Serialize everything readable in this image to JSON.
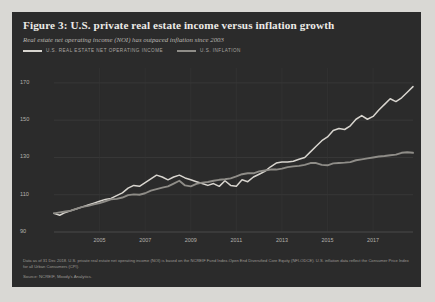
{
  "figure": {
    "title": "Figure 3: U.S. private real estate income versus inflation growth",
    "subtitle": "Real estate net operating income (NOI) has outpaced inflation since 2003",
    "note": "Data as of 31 Dec 2018. U.S. private real estate net operating income (NOI) is based on the NCREIF Fund Index-Open End Diversified Core Equity (NFI-ODCE). U.S. inflation data reflect the Consumer Price Index for all Urban Consumers (CPI).",
    "source": "Source: NCREIF, Moody's Analytics.",
    "panel_color": "#2b2b2b",
    "page_color": "#d9d8d4"
  },
  "legend": {
    "items": [
      {
        "label": "U.S. real estate net operating income",
        "color": "#d8d5cf"
      },
      {
        "label": "U.S. inflation",
        "color": "#8f8d88"
      }
    ]
  },
  "chart_data": {
    "type": "line",
    "title": "Figure 3: U.S. private real estate income versus inflation growth",
    "subtitle": "Real estate net operating income (NOI) has outpaced inflation since 2003",
    "xlabel": "",
    "ylabel": "",
    "index_base": "2003 = 100",
    "xlim": [
      2003,
      2018.75
    ],
    "ylim": [
      90,
      178
    ],
    "yticks": [
      90,
      110,
      130,
      150,
      170
    ],
    "xticks": [
      2005,
      2007,
      2009,
      2011,
      2013,
      2015,
      2017
    ],
    "grid": true,
    "legend_position": "top-left",
    "x": [
      2003.0,
      2003.25,
      2003.5,
      2003.75,
      2004.0,
      2004.25,
      2004.5,
      2004.75,
      2005.0,
      2005.25,
      2005.5,
      2005.75,
      2006.0,
      2006.25,
      2006.5,
      2006.75,
      2007.0,
      2007.25,
      2007.5,
      2007.75,
      2008.0,
      2008.25,
      2008.5,
      2008.75,
      2009.0,
      2009.25,
      2009.5,
      2009.75,
      2010.0,
      2010.25,
      2010.5,
      2010.75,
      2011.0,
      2011.25,
      2011.5,
      2011.75,
      2012.0,
      2012.25,
      2012.5,
      2012.75,
      2013.0,
      2013.25,
      2013.5,
      2013.75,
      2014.0,
      2014.25,
      2014.5,
      2014.75,
      2015.0,
      2015.25,
      2015.5,
      2015.75,
      2016.0,
      2016.25,
      2016.5,
      2016.75,
      2017.0,
      2017.25,
      2017.5,
      2017.75,
      2018.0,
      2018.25,
      2018.5,
      2018.75
    ],
    "series": [
      {
        "name": "U.S. real estate net operating income",
        "color": "#d8d5cf",
        "values": [
          100.0,
          99.0,
          100.5,
          101.5,
          102.5,
          103.5,
          104.5,
          105.5,
          106.5,
          107.5,
          108.0,
          109.5,
          111.0,
          113.5,
          115.0,
          114.5,
          116.5,
          118.5,
          120.5,
          119.5,
          118.0,
          119.5,
          120.5,
          119.0,
          118.0,
          117.0,
          116.0,
          115.0,
          116.0,
          114.5,
          117.5,
          115.0,
          114.5,
          118.0,
          117.0,
          119.5,
          121.0,
          122.5,
          125.0,
          127.0,
          127.5,
          127.5,
          128.0,
          129.0,
          130.0,
          133.0,
          136.0,
          139.0,
          141.0,
          144.5,
          145.5,
          145.0,
          147.0,
          150.5,
          152.5,
          150.5,
          152.0,
          155.5,
          158.5,
          161.5,
          160.0,
          162.0,
          165.0,
          168.0
        ]
      },
      {
        "name": "U.S. inflation",
        "color": "#8f8d88",
        "values": [
          100.0,
          100.5,
          101.0,
          101.5,
          102.5,
          103.5,
          104.0,
          104.8,
          105.5,
          106.5,
          107.5,
          107.8,
          108.5,
          109.8,
          110.2,
          110.0,
          110.8,
          112.2,
          113.0,
          113.8,
          114.5,
          116.0,
          117.5,
          115.0,
          114.5,
          115.8,
          116.5,
          116.8,
          117.5,
          118.0,
          118.3,
          118.8,
          119.8,
          121.0,
          121.5,
          121.5,
          122.5,
          123.0,
          123.5,
          123.5,
          124.0,
          124.8,
          125.2,
          125.5,
          126.0,
          127.0,
          127.0,
          126.0,
          125.8,
          126.8,
          127.0,
          127.2,
          127.5,
          128.5,
          129.0,
          129.5,
          130.0,
          130.5,
          130.8,
          131.2,
          131.5,
          132.5,
          132.8,
          132.5
        ]
      }
    ]
  }
}
